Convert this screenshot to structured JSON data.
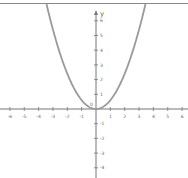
{
  "chart_data": {
    "type": "line",
    "title": "",
    "xlabel": "",
    "ylabel": "y",
    "function": "y = 0.6x^2",
    "xlim": [
      -6.6,
      6.4
    ],
    "ylim": [
      -4.7,
      7.2
    ],
    "grid": false,
    "x_ticks": [
      -6,
      -5,
      -4,
      -3,
      -2,
      -1,
      1,
      2,
      3,
      4,
      5,
      6
    ],
    "y_ticks": [
      6,
      5,
      4,
      3,
      2,
      1,
      -1,
      -2,
      -3,
      -4
    ],
    "origin_label": "0",
    "series": [
      {
        "name": "parabola",
        "color": "#9a9a9a",
        "x": [
          -3.4,
          -3,
          -2.5,
          -2,
          -1.5,
          -1,
          -0.5,
          0,
          0.5,
          1,
          1.5,
          2,
          2.5,
          3,
          3.4
        ],
        "y": [
          6.94,
          5.4,
          3.75,
          2.4,
          1.35,
          0.6,
          0.15,
          0,
          0.15,
          0.6,
          1.35,
          2.4,
          3.75,
          5.4,
          6.94
        ]
      }
    ]
  },
  "colors": {
    "axis": "#777777",
    "curve": "#9a9a9a",
    "label": "#666666",
    "top_border": "#8a8a8a"
  }
}
